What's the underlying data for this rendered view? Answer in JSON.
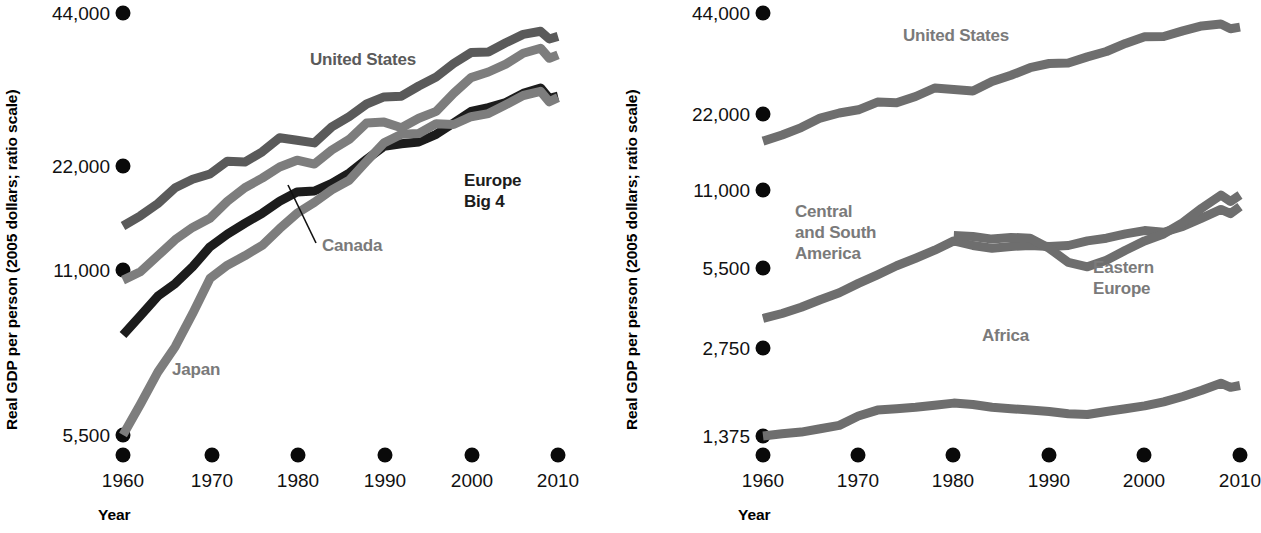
{
  "figure": {
    "background": "#ffffff",
    "width": 1261,
    "height": 533
  },
  "colors": {
    "united_states": "#5a5a5a",
    "canada": "#7d7d7d",
    "europe_big4": "#1c1c1c",
    "japan": "#7d7d7d",
    "central_south_america": "#6e6e6e",
    "eastern_europe": "#6e6e6e",
    "africa": "#6e6e6e",
    "tick_dot": "#0a0a0a",
    "axis_text": "#111111",
    "label_gray": "#7a7a7a",
    "label_dark": "#1c1c1c"
  },
  "panels": [
    {
      "id": "left-panel",
      "axis": {
        "ylabel": "Real GDP per person (2005 dollars; ratio scale)",
        "xlabel": "Year",
        "ytick_labels": [
          "44,000",
          "22,000",
          "11,000",
          "5,500"
        ],
        "ytick_values": [
          44000,
          22000,
          11000,
          5500
        ],
        "xtick_labels": [
          "1960",
          "1970",
          "1980",
          "1990",
          "2000",
          "2010"
        ],
        "xtick_values": [
          1960,
          1970,
          1980,
          1990,
          2000,
          2010
        ]
      },
      "series_labels": [
        {
          "name": "United States",
          "tone": "dark-gray"
        },
        {
          "name": "Europe\nBig 4",
          "tone": "near-black"
        },
        {
          "name": "Canada",
          "tone": "gray"
        },
        {
          "name": "Japan",
          "tone": "gray"
        }
      ]
    },
    {
      "id": "right-panel",
      "axis": {
        "ylabel": "Real GDP per person (2005 dollars; ratio scale)",
        "xlabel": "Year",
        "ytick_labels": [
          "44,000",
          "22,000",
          "11,000",
          "5,500",
          "2,750",
          "1,375"
        ],
        "ytick_values": [
          44000,
          22000,
          11000,
          5500,
          2750,
          1375
        ],
        "xtick_labels": [
          "1960",
          "1970",
          "1980",
          "1990",
          "2000",
          "2010"
        ],
        "xtick_values": [
          1960,
          1970,
          1980,
          1990,
          2000,
          2010
        ]
      },
      "series_labels": [
        {
          "name": "United States",
          "tone": "gray"
        },
        {
          "name": "Central\nand South\nAmerica",
          "tone": "gray"
        },
        {
          "name": "Eastern\nEurope",
          "tone": "gray"
        },
        {
          "name": "Africa",
          "tone": "gray"
        }
      ]
    }
  ],
  "chart_data": [
    {
      "type": "line",
      "id": "left-panel",
      "title": "",
      "xlabel": "Year",
      "ylabel": "Real GDP per person (2005 dollars; ratio scale)",
      "scale": "log",
      "xlim": [
        1960,
        2010
      ],
      "ylim": [
        4800,
        48000
      ],
      "grid": false,
      "legend": "inline-labels",
      "x": [
        1960,
        1962,
        1964,
        1966,
        1968,
        1970,
        1972,
        1974,
        1976,
        1978,
        1980,
        1982,
        1984,
        1986,
        1988,
        1990,
        1992,
        1994,
        1996,
        1998,
        2000,
        2002,
        2004,
        2006,
        2008,
        2009,
        2010
      ],
      "series": [
        {
          "name": "United States",
          "color": "#5a5a5a",
          "values": [
            15400,
            16200,
            17200,
            18600,
            19400,
            19900,
            21200,
            21100,
            22200,
            23800,
            23500,
            23200,
            25100,
            26400,
            28100,
            29100,
            29200,
            30700,
            32100,
            34300,
            36200,
            36300,
            38000,
            39600,
            40200,
            38700,
            39200
          ]
        },
        {
          "name": "Canada",
          "color": "#7d7d7d",
          "values": [
            11800,
            12300,
            13300,
            14400,
            15300,
            16000,
            17400,
            18600,
            19500,
            20600,
            21300,
            20900,
            22400,
            23600,
            25600,
            25700,
            25000,
            26200,
            27100,
            29600,
            32000,
            32900,
            34200,
            36100,
            37000,
            35200,
            35800
          ]
        },
        {
          "name": "Europe Big 4",
          "color": "#1c1c1c",
          "values": [
            9000,
            9900,
            10900,
            11600,
            12600,
            13900,
            14800,
            15600,
            16400,
            17400,
            18200,
            18300,
            19000,
            20000,
            21400,
            22800,
            23100,
            23300,
            24200,
            25600,
            27100,
            27600,
            28300,
            29600,
            30400,
            28900,
            29200
          ]
        },
        {
          "name": "Japan",
          "color": "#7d7d7d",
          "values": [
            5500,
            6400,
            7500,
            8500,
            10000,
            11900,
            12700,
            13300,
            14000,
            15200,
            16400,
            17300,
            18400,
            19300,
            21200,
            23200,
            24200,
            24300,
            25500,
            25400,
            26400,
            26800,
            28000,
            29300,
            29900,
            28400,
            29000
          ]
        }
      ]
    },
    {
      "type": "line",
      "id": "right-panel",
      "title": "",
      "xlabel": "Year",
      "ylabel": "Real GDP per person (2005 dollars; ratio scale)",
      "scale": "log",
      "xlim": [
        1960,
        2010
      ],
      "ylim": [
        1250,
        48000
      ],
      "grid": false,
      "legend": "inline-labels",
      "x": [
        1960,
        1962,
        1964,
        1966,
        1968,
        1970,
        1972,
        1974,
        1976,
        1978,
        1980,
        1982,
        1984,
        1986,
        1988,
        1990,
        1992,
        1994,
        1996,
        1998,
        2000,
        2002,
        2004,
        2006,
        2008,
        2009,
        2010
      ],
      "series": [
        {
          "name": "United States",
          "color": "#6e6e6e",
          "values": [
            15400,
            16200,
            17200,
            18600,
            19400,
            19900,
            21200,
            21100,
            22200,
            23800,
            23500,
            23200,
            25100,
            26400,
            28100,
            29100,
            29200,
            30700,
            32100,
            34300,
            36200,
            36300,
            38000,
            39600,
            40200,
            38700,
            39200
          ]
        },
        {
          "name": "Central and South America",
          "color": "#6e6e6e",
          "values": [
            3600,
            3750,
            3950,
            4200,
            4450,
            4800,
            5150,
            5550,
            5900,
            6300,
            6800,
            6550,
            6400,
            6500,
            6550,
            6500,
            6550,
            6800,
            6950,
            7200,
            7400,
            7300,
            7650,
            8200,
            8800,
            8500,
            9000
          ]
        },
        {
          "name": "Eastern Europe",
          "color": "#6e6e6e",
          "values": [
            null,
            null,
            null,
            null,
            null,
            null,
            null,
            null,
            null,
            null,
            7100,
            7050,
            6900,
            7000,
            6950,
            6400,
            5700,
            5500,
            5800,
            6300,
            6800,
            7200,
            7900,
            8900,
            9900,
            9400,
            9900
          ]
        },
        {
          "name": "Africa",
          "color": "#6e6e6e",
          "values": [
            1375,
            1400,
            1420,
            1460,
            1500,
            1620,
            1700,
            1720,
            1740,
            1770,
            1800,
            1780,
            1740,
            1720,
            1700,
            1680,
            1650,
            1640,
            1680,
            1720,
            1760,
            1820,
            1900,
            2000,
            2120,
            2050,
            2080
          ]
        }
      ]
    }
  ],
  "annotations": {
    "canada_callout": "Canada"
  }
}
